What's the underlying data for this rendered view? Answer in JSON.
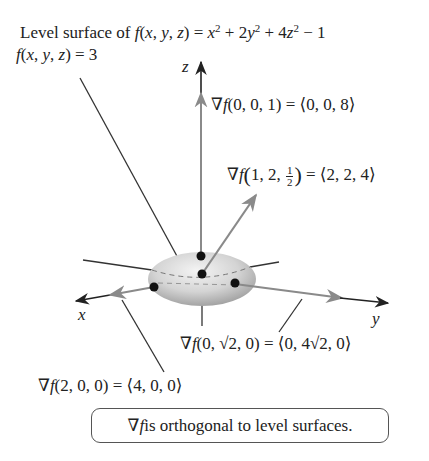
{
  "title": {
    "prefix": "Level surface of ",
    "function": "f(x, y, z) = x² + 2y² + 4z² − 1"
  },
  "level_label": "f(x, y, z) = 3",
  "axes": {
    "x": "x",
    "y": "y",
    "z": "z"
  },
  "gradients": [
    {
      "point": "(0, 0, 1)",
      "value": "⟨0, 0, 8⟩",
      "label": "∇f(0, 0, 1) = ⟨0, 0, 8⟩"
    },
    {
      "point": "(1, 2, 1/2)",
      "value": "⟨2, 2, 4⟩",
      "label": "∇f(1, 2, ½) = ⟨2, 2, 4⟩"
    },
    {
      "point": "(0, √2, 0)",
      "value": "⟨0, 4√2, 0⟩",
      "label": "∇f(0, √2, 0) = ⟨0, 4√2, 0⟩"
    },
    {
      "point": "(2, 0, 0)",
      "value": "⟨4, 0, 0⟩",
      "label": "∇f(2, 0, 0) = ⟨4, 0, 0⟩"
    }
  ],
  "grad1": {
    "nabla": "∇",
    "f": "f",
    "args": "(0, 0, 1) = ⟨0, 0, 8⟩"
  },
  "grad2": {
    "nabla": "∇",
    "f": "f",
    "open": "(",
    "args_a": "1, 2, ",
    "num": "1",
    "den": "2",
    "close": ")",
    "rest": " = ⟨2, 2, 4⟩"
  },
  "grad3": {
    "nabla": "∇",
    "f": "f",
    "args": "(0, √2, 0) = ⟨0, 4√2, 0⟩"
  },
  "grad4": {
    "nabla": "∇",
    "f": "f",
    "args": "(2, 0, 0) = ⟨4, 0, 0⟩"
  },
  "note": {
    "nabla": "∇",
    "f": "f",
    "text": " is orthogonal to level surfaces."
  },
  "colors": {
    "axis": "#222222",
    "gradient_arrow": "#8a8a8a",
    "ellipsoid_light": "#f0f0f0",
    "ellipsoid_dark": "#a8a8a8",
    "point": "#111111"
  }
}
